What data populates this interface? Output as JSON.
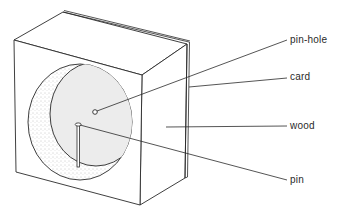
{
  "diagram": {
    "labels": {
      "pin_hole": "pin-hole",
      "card": "card",
      "wood": "wood",
      "pin": "pin"
    },
    "colors": {
      "line": "#2a2a2a",
      "background": "#ffffff",
      "card_fill": "#ececec",
      "recess_stipple": "#9a9a9a"
    }
  }
}
